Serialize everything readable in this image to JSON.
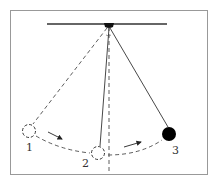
{
  "diagram": {
    "type": "pendulum-motion",
    "positions": [
      {
        "id": "1",
        "label": "1",
        "state": "previous",
        "style": "dashed-outline"
      },
      {
        "id": "2",
        "label": "2",
        "state": "previous",
        "style": "dashed-outline"
      },
      {
        "id": "3",
        "label": "3",
        "state": "current",
        "style": "solid-filled"
      }
    ],
    "colors": {
      "frame": "#888888",
      "ink": "#222222",
      "bob": "#000000"
    }
  }
}
